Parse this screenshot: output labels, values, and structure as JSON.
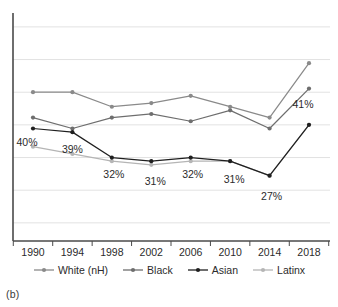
{
  "figure": {
    "caption": "(b)",
    "title_clipped": ""
  },
  "chart_data": {
    "type": "line",
    "title": "",
    "xlabel": "",
    "ylabel": "",
    "grid": true,
    "legend_position": "bottom",
    "categories": [
      "1990",
      "1994",
      "1998",
      "2002",
      "2006",
      "2010",
      "2014",
      "2018"
    ],
    "series": [
      {
        "name": "White (nH)",
        "color": "#8a8a8a",
        "values": [
          50,
          50,
          46,
          47,
          49,
          46,
          43,
          58
        ]
      },
      {
        "name": "Black",
        "color": "#6e6e6e",
        "values": [
          43,
          40,
          43,
          44,
          42,
          45,
          40,
          51
        ]
      },
      {
        "name": "Asian",
        "color": "#1f1f1f",
        "values": [
          40,
          39,
          32,
          31,
          32,
          31,
          27,
          41
        ],
        "labels": [
          "40%",
          "39%",
          "32%",
          "31%",
          "32%",
          "31%",
          "27%",
          "41%"
        ]
      },
      {
        "name": "Latinx",
        "color": "#b5b5b5",
        "values": [
          35,
          33,
          31,
          30,
          31,
          31,
          27,
          41
        ]
      }
    ],
    "ylim": [
      9,
      71
    ],
    "gridline_values": [
      14,
      23,
      32,
      41,
      50,
      59,
      68
    ],
    "data_label_series": "Asian"
  },
  "axes": {
    "x_ticks": [
      "1990",
      "1994",
      "1998",
      "2002",
      "2006",
      "2010",
      "2014",
      "2018"
    ],
    "y_ticks": []
  },
  "legend": {
    "items": [
      {
        "label": "White (nH)",
        "color": "#8a8a8a",
        "marker": "circle"
      },
      {
        "label": "Black",
        "color": "#6e6e6e",
        "marker": "circle"
      },
      {
        "label": "Asian",
        "color": "#1f1f1f",
        "marker": "circle"
      },
      {
        "label": "Latinx",
        "color": "#b5b5b5",
        "marker": "circle"
      }
    ]
  },
  "colors": {
    "axis": "#4a4a4a",
    "grid": "#e2e2e2",
    "text": "#2b2b2b",
    "background": "#ffffff"
  }
}
